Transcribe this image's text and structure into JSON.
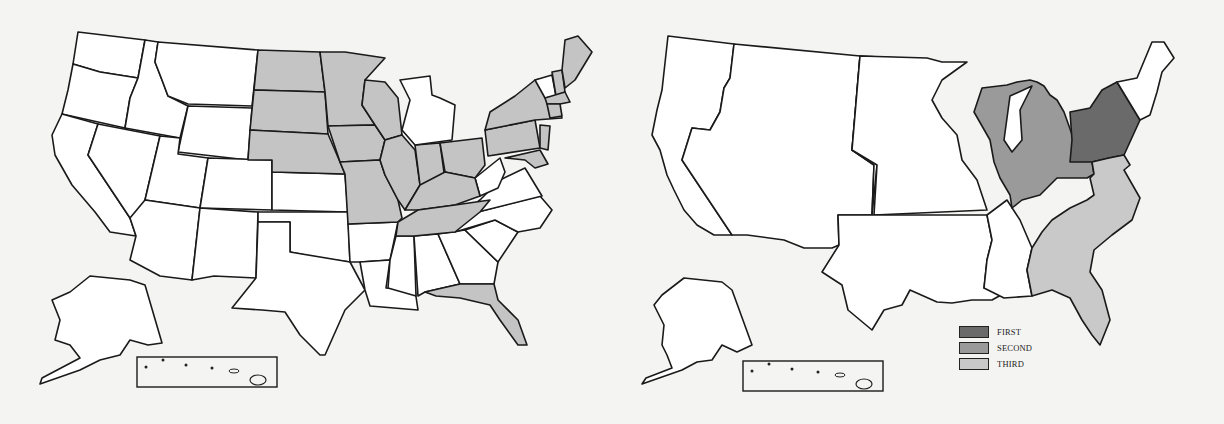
{
  "colors": {
    "state_fill": "#ffffff",
    "shaded": "#c4c4c4",
    "first": "#6a6a6a",
    "second": "#9a9a9a",
    "third": "#c9c9c9",
    "outline": "#1a1a1a",
    "background": "#f4f4f2"
  },
  "left_map": {
    "title": "",
    "shaded_states": [
      "ND",
      "SD",
      "NE",
      "MN",
      "IA",
      "MO",
      "WI",
      "IL",
      "IN",
      "OH",
      "KY",
      "TN",
      "PA",
      "NY",
      "NJ",
      "ME",
      "NH",
      "MA",
      "CT",
      "RI",
      "MD",
      "FL"
    ],
    "unshaded_states": [
      "WA",
      "OR",
      "CA",
      "ID",
      "NV",
      "MT",
      "WY",
      "UT",
      "AZ",
      "CO",
      "NM",
      "KS",
      "OK",
      "TX",
      "AR",
      "LA",
      "MS",
      "AL",
      "GA",
      "SC",
      "NC",
      "VA",
      "WV",
      "MI",
      "VT",
      "DE",
      "AK",
      "HI"
    ],
    "insets": [
      "alaska-inset",
      "hawaii-inset"
    ]
  },
  "right_map": {
    "regions": [
      {
        "id": "first",
        "label": "FIRST",
        "area": "New York & Pennsylvania"
      },
      {
        "id": "second",
        "label": "SECOND",
        "area": "Great Lakes (WI, MI, IL, IN, OH)"
      },
      {
        "id": "third",
        "label": "THIRD",
        "area": "Southeast Atlantic (KY, TN, VA, NC, SC, GA, FL, AL)"
      }
    ],
    "legend": {
      "items": [
        {
          "label": "FIRST",
          "color": "#6a6a6a"
        },
        {
          "label": "SECOND",
          "color": "#9a9a9a"
        },
        {
          "label": "THIRD",
          "color": "#c9c9c9"
        }
      ]
    },
    "insets": [
      "alaska-inset",
      "hawaii-inset"
    ]
  }
}
